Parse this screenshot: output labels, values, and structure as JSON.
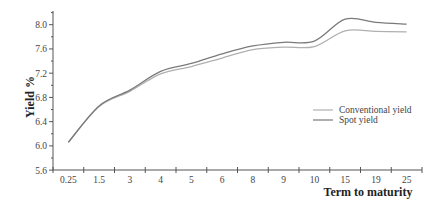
{
  "chart_data": {
    "type": "line",
    "title": "",
    "xlabel": "Term to maturity",
    "ylabel": "Yield %",
    "categories": [
      "0.25",
      "1.5",
      "3",
      "4",
      "5",
      "6",
      "8",
      "9",
      "10",
      "15",
      "19",
      "25"
    ],
    "series": [
      {
        "name": "Conventional yield",
        "color": "#b0b0b0",
        "values": [
          6.06,
          6.65,
          6.9,
          7.19,
          7.31,
          7.45,
          7.59,
          7.63,
          7.64,
          7.9,
          7.89,
          7.88
        ]
      },
      {
        "name": "Spot yield",
        "color": "#7a7a7a",
        "values": [
          6.06,
          6.66,
          6.92,
          7.23,
          7.36,
          7.52,
          7.65,
          7.71,
          7.73,
          8.09,
          8.04,
          8.01
        ]
      }
    ],
    "yticks": [
      "5.6",
      "6.0",
      "6.4",
      "6.8",
      "7.2",
      "7.6",
      "8.0"
    ],
    "ylim": [
      5.6,
      8.2
    ],
    "grid": false,
    "legend_position": "right-center"
  }
}
